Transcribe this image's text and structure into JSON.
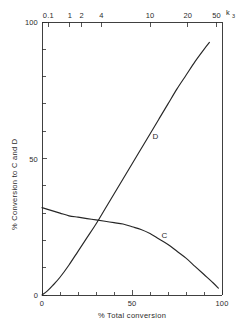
{
  "chart_data": {
    "type": "line",
    "title": "",
    "xlabel": "% Total conversion",
    "ylabel": "% Conversion to C and D",
    "top_axis_label": "k",
    "top_axis_label_sub": "3",
    "xlim": [
      0,
      100
    ],
    "ylim": [
      0,
      100
    ],
    "grid": false,
    "legend": "inline-curve-labels",
    "x_ticks_major": [
      0,
      50,
      100
    ],
    "x_tick_labels": [
      "0",
      "50",
      "100"
    ],
    "x_ticks_minor": [
      10,
      20,
      30,
      40,
      60,
      70,
      80,
      90
    ],
    "y_ticks_major": [
      0,
      50,
      100
    ],
    "y_tick_labels": [
      "0",
      "50",
      "100"
    ],
    "y_ticks_minor": [
      10,
      20,
      30,
      40,
      60,
      70,
      80,
      90
    ],
    "top_axis": {
      "label": "k3",
      "scale": "log",
      "tick_values": [
        0.1,
        1,
        2,
        4,
        10,
        20,
        50
      ],
      "tick_labels": [
        "0.1",
        "1",
        "2",
        "4",
        "10",
        "20",
        "50"
      ],
      "tick_x_percent": [
        3.5,
        15.5,
        22,
        33,
        60,
        81,
        97
      ]
    },
    "series": [
      {
        "name": "D",
        "label": "D",
        "label_x": 63,
        "label_y": 57,
        "points": [
          [
            0,
            0
          ],
          [
            3,
            1.5
          ],
          [
            6,
            3.5
          ],
          [
            10,
            6.5
          ],
          [
            15,
            11
          ],
          [
            20,
            16
          ],
          [
            25,
            21
          ],
          [
            30,
            26
          ],
          [
            35,
            31.5
          ],
          [
            40,
            37
          ],
          [
            45,
            42.5
          ],
          [
            50,
            48
          ],
          [
            55,
            53.5
          ],
          [
            60,
            59
          ],
          [
            65,
            64.5
          ],
          [
            70,
            70
          ],
          [
            75,
            75.5
          ],
          [
            80,
            80.5
          ],
          [
            85,
            85.5
          ],
          [
            90,
            90
          ],
          [
            93,
            92.5
          ]
        ]
      },
      {
        "name": "C",
        "label": "C",
        "label_x": 68,
        "label_y": 21,
        "points": [
          [
            0,
            32
          ],
          [
            5,
            31
          ],
          [
            10,
            30
          ],
          [
            15,
            29
          ],
          [
            20,
            28.5
          ],
          [
            25,
            28
          ],
          [
            30,
            27.5
          ],
          [
            35,
            27
          ],
          [
            40,
            26.5
          ],
          [
            45,
            26
          ],
          [
            50,
            25
          ],
          [
            55,
            24
          ],
          [
            60,
            22.5
          ],
          [
            65,
            20.5
          ],
          [
            70,
            18.5
          ],
          [
            75,
            16
          ],
          [
            80,
            13.5
          ],
          [
            85,
            10.5
          ],
          [
            90,
            7.5
          ],
          [
            95,
            4.5
          ],
          [
            98,
            2.5
          ]
        ]
      }
    ]
  },
  "axes": {
    "left_title": "% Conversion to C and D",
    "bottom_title": "% Total conversion"
  }
}
